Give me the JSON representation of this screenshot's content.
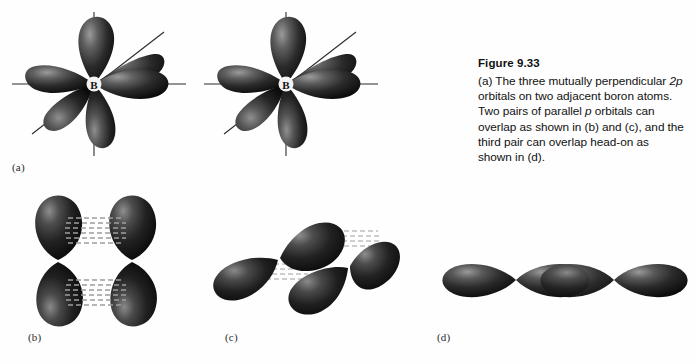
{
  "figure": {
    "number_label": "Figure 9.33",
    "caption_parts": {
      "p1": "(a) The three mutually perpendicular ",
      "em1": "2p",
      "p2": " orbitals on two adjacent boron atoms. Two pairs of parallel ",
      "em2": "p",
      "p3": " orbitals can overlap as shown in (b) and (c), and the third pair can overlap head-on as shown in (d)."
    },
    "caption_plain": "(a) The three mutually perpendicular 2p orbitals on two adjacent boron atoms. Two pairs of parallel p orbitals can overlap as shown in (b) and (c), and the third pair can overlap head-on as shown in (d)."
  },
  "panels": [
    {
      "id": "a",
      "label": "(a)",
      "description": "Three mutually perpendicular 2p orbitals on two adjacent boron atoms",
      "atom_label": "B",
      "atom_count": 2,
      "lobes_per_atom": 6,
      "axes_per_atom": 3
    },
    {
      "id": "b",
      "label": "(b)",
      "description": "Two parallel p orbitals overlapping side-by-side (vertical pair)",
      "orbital_count": 2,
      "overlap_regions": 2,
      "overlap_style": "dashed-lines"
    },
    {
      "id": "c",
      "label": "(c)",
      "description": "Two parallel p orbitals overlapping side-by-side (tilted pair)",
      "orbital_count": 2,
      "overlap_regions": 2,
      "overlap_style": "dashed-lines"
    },
    {
      "id": "d",
      "label": "(d)",
      "description": "Two p orbitals overlapping head-on along the internuclear axis",
      "orbital_count": 2,
      "lobe_count": 4,
      "overlap_style": "head-on"
    }
  ],
  "colors": {
    "page_background": "#fefefe",
    "lobe_dark": "#141414",
    "lobe_mid": "#3c3c3c",
    "lobe_highlight": "#8d8d8d",
    "axis_line": "#2b2b2b",
    "overlap_dash": "#9a9a9a",
    "text": "#111111"
  }
}
